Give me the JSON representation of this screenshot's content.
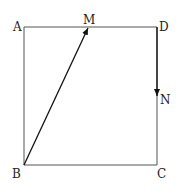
{
  "diagram": {
    "type": "geometry",
    "colors": {
      "line": "#555555",
      "arrow": "#111111",
      "label": "#222222",
      "background": "#ffffff"
    },
    "points": {
      "A": {
        "label": "A",
        "x": 24,
        "y": 27
      },
      "D": {
        "label": "D",
        "x": 157,
        "y": 27
      },
      "B": {
        "label": "B",
        "x": 24,
        "y": 165
      },
      "C": {
        "label": "C",
        "x": 157,
        "y": 165
      },
      "M": {
        "label": "M",
        "x": 88,
        "y": 27
      },
      "N": {
        "label": "N",
        "x": 157,
        "y": 97
      }
    },
    "vectors": [
      {
        "name": "BM",
        "from": "B",
        "to": "M"
      },
      {
        "name": "DN",
        "from": "D",
        "to": "N"
      }
    ]
  }
}
